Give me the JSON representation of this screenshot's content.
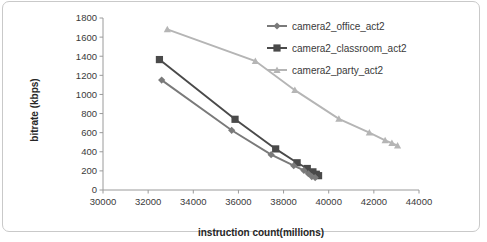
{
  "chart_data": {
    "type": "line",
    "title": "",
    "xlabel": "instruction count(millions)",
    "ylabel": "bitrate (kbps)",
    "xlim": [
      30000,
      44000
    ],
    "ylim": [
      0,
      1800
    ],
    "xticks": [
      30000,
      32000,
      34000,
      36000,
      38000,
      40000,
      42000,
      44000
    ],
    "yticks": [
      0,
      200,
      400,
      600,
      800,
      1000,
      1200,
      1400,
      1600,
      1800
    ],
    "grid": false,
    "legend_position": "top-right",
    "series": [
      {
        "name": "camera2_office_act2",
        "marker": "diamond",
        "color": "#7a7a7a",
        "points": [
          {
            "x": 32600,
            "y": 1150
          },
          {
            "x": 35700,
            "y": 625
          },
          {
            "x": 37450,
            "y": 370
          },
          {
            "x": 38450,
            "y": 255
          },
          {
            "x": 38900,
            "y": 205
          },
          {
            "x": 39100,
            "y": 170
          },
          {
            "x": 39250,
            "y": 140
          },
          {
            "x": 39400,
            "y": 130
          }
        ]
      },
      {
        "name": "camera2_classroom_act2",
        "marker": "square",
        "color": "#4a4a4a",
        "points": [
          {
            "x": 32500,
            "y": 1365
          },
          {
            "x": 35850,
            "y": 740
          },
          {
            "x": 37650,
            "y": 430
          },
          {
            "x": 38600,
            "y": 285
          },
          {
            "x": 39050,
            "y": 225
          },
          {
            "x": 39300,
            "y": 190
          },
          {
            "x": 39450,
            "y": 165
          },
          {
            "x": 39550,
            "y": 150
          }
        ]
      },
      {
        "name": "camera2_party_act2",
        "marker": "triangle",
        "color": "#b5b5b5",
        "points": [
          {
            "x": 32850,
            "y": 1680
          },
          {
            "x": 36750,
            "y": 1350
          },
          {
            "x": 38500,
            "y": 1045
          },
          {
            "x": 40450,
            "y": 745
          },
          {
            "x": 41800,
            "y": 600
          },
          {
            "x": 42500,
            "y": 520
          },
          {
            "x": 42800,
            "y": 490
          },
          {
            "x": 43050,
            "y": 465
          }
        ]
      }
    ]
  }
}
